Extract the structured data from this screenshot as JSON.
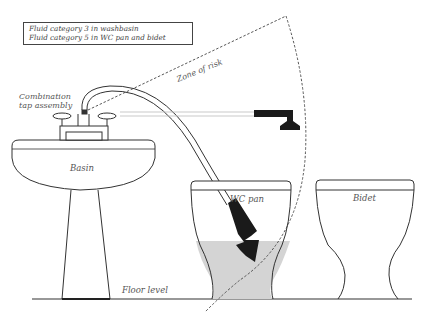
{
  "legend": {
    "lines": [
      "Fluid category 3 in washbasin",
      "Fluid category 5 in WC pan and bidet"
    ]
  },
  "labels": {
    "zone_of_risk": "Zone of risk",
    "combination_tap_line1": "Combination",
    "combination_tap_line2": "tap assembly",
    "basin": "Basin",
    "wc_pan": "WC pan",
    "bidet": "Bidet",
    "floor_level": "Floor level"
  },
  "colors": {
    "line": "#333333",
    "label": "#555555",
    "water_fill": "#d4d4d4",
    "shower_head": "#1a1a1a",
    "dashed_zone": "#444444"
  }
}
